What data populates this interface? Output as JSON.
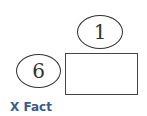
{
  "diagram": {
    "top_ellipse": {
      "label": "1"
    },
    "left_ellipse": {
      "label": "6"
    },
    "box": {
      "label": ""
    },
    "caption": "X Fact",
    "colors": {
      "caption": "#3b5a8a",
      "stroke": "#333333"
    }
  }
}
